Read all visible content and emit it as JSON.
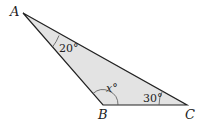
{
  "diagram": {
    "type": "triangle",
    "fill_color": "#e3e3e3",
    "stroke_color": "#222222",
    "vertices": [
      {
        "label": "A",
        "x": 23,
        "y": 13
      },
      {
        "label": "B",
        "x": 103,
        "y": 105
      },
      {
        "label": "C",
        "x": 187,
        "y": 105
      }
    ],
    "angles": [
      {
        "vertex": "A",
        "label": "20°"
      },
      {
        "vertex": "B",
        "label": "x°",
        "variable": "x"
      },
      {
        "vertex": "C",
        "label": "30°"
      }
    ]
  }
}
